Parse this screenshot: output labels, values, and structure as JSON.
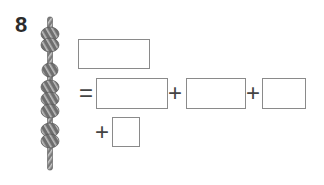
{
  "problem": {
    "number": "8",
    "rope": {
      "description": "rope with knot groups",
      "knot_groups": [
        2,
        1,
        3,
        2
      ],
      "color": "#6f6f6f"
    },
    "expression": {
      "total_box": "",
      "equals": "=",
      "plus": "+",
      "addend_boxes": [
        "",
        "",
        "",
        ""
      ]
    }
  }
}
